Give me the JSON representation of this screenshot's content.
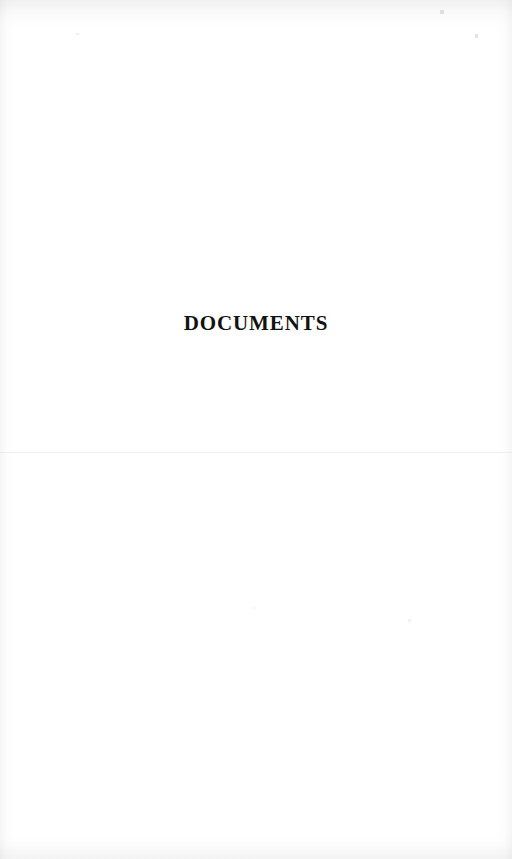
{
  "page": {
    "kind": "scanned-book-page",
    "section_divider_title": "DOCUMENTS",
    "background_color": "#ffffff",
    "text_color": "#121212"
  },
  "artifacts": {
    "top_band_label": "",
    "bottom_band_label": "",
    "left_band_label": "",
    "right_band_label": "",
    "seam_label": ""
  }
}
